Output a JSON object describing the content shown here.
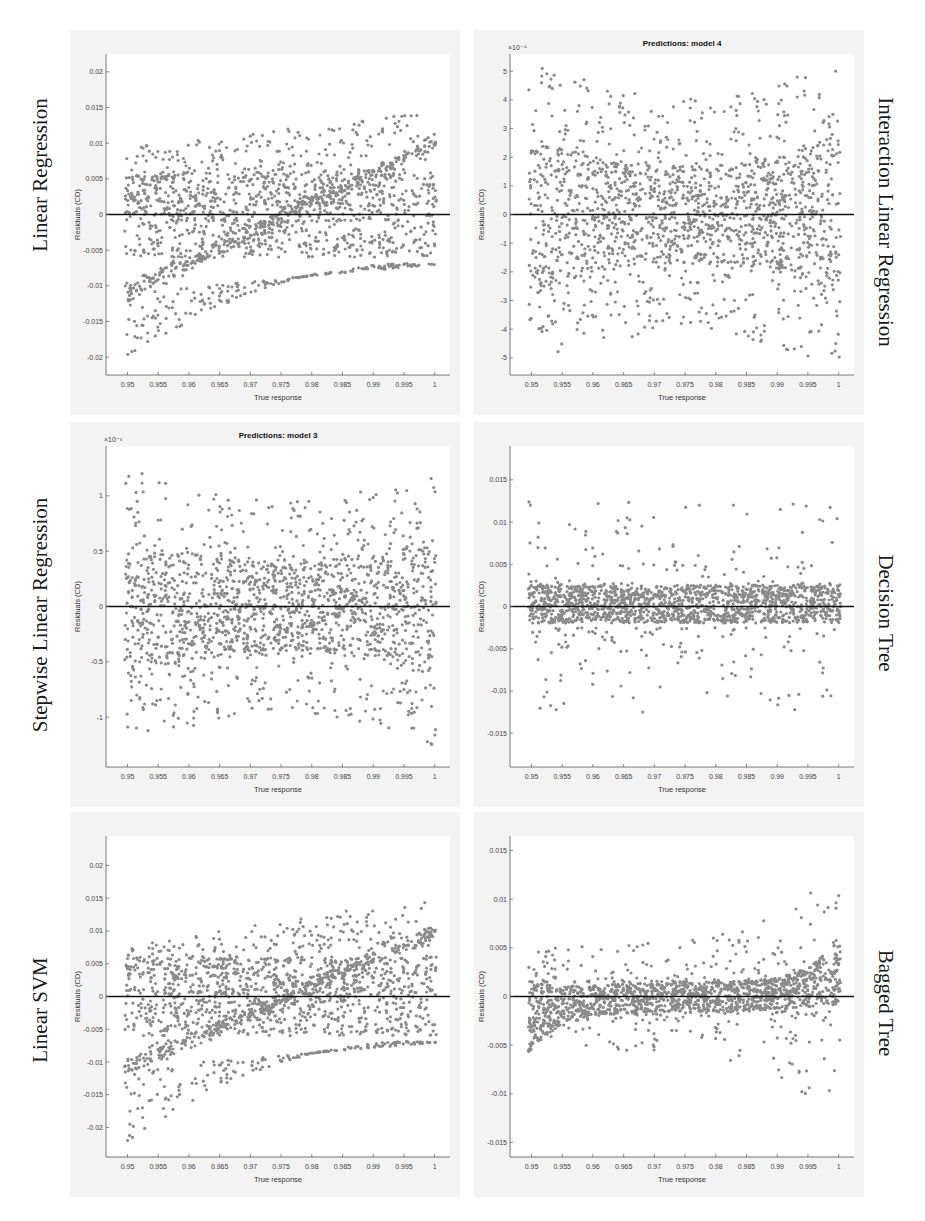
{
  "figure": {
    "side_labels": {
      "left": [
        "Linear Regression",
        "Stepwise Linear Regression",
        "Linear SVM"
      ],
      "right": [
        "Interaction Linear Regression",
        "Decision Tree",
        "Bagged Tree"
      ]
    },
    "point_color": "#8a8a8a",
    "zero_line_color": "#111111",
    "panel_bg": "#f3f3f3"
  },
  "chart_data": [
    {
      "type": "scatter",
      "model": "Linear Regression",
      "title": "",
      "xlabel": "True response",
      "ylabel": "Residuals (CD)",
      "exponent": "",
      "xlim": [
        0.9465,
        1.0025
      ],
      "ylim": [
        -0.0225,
        0.0225
      ],
      "xticks": [
        0.95,
        0.955,
        0.96,
        0.965,
        0.97,
        0.975,
        0.98,
        0.985,
        0.99,
        0.995,
        1
      ],
      "xtick_labels": [
        "0.95",
        "0.955",
        "0.96",
        "0.965",
        "0.97",
        "0.975",
        "0.98",
        "0.985",
        "0.99",
        "0.995",
        "1"
      ],
      "yticks": [
        -0.02,
        -0.015,
        -0.01,
        -0.005,
        0,
        0.005,
        0.01,
        0.015,
        0.02
      ],
      "ytick_labels": [
        "-0.02",
        "-0.015",
        "-0.01",
        "-0.005",
        "0",
        "0.005",
        "0.01",
        "0.015",
        "0.02"
      ],
      "reference_line_y": 0,
      "pattern": "linear-trend",
      "band_low": [
        -0.011,
        -0.007
      ],
      "band_high": [
        0.011,
        0.017
      ],
      "core_half_width": 0.006,
      "outlier_range": [
        -0.0205,
        0.0185
      ],
      "grid": false
    },
    {
      "type": "scatter",
      "model": "Interaction Linear Regression",
      "title": "Predictions: model 4",
      "xlabel": "True response",
      "ylabel": "Residuals (CD)",
      "exponent": "×10⁻⁴",
      "xlim": [
        0.9465,
        1.0025
      ],
      "ylim": [
        -5.6,
        5.6
      ],
      "xticks": [
        0.95,
        0.955,
        0.96,
        0.965,
        0.97,
        0.975,
        0.98,
        0.985,
        0.99,
        0.995,
        1
      ],
      "xtick_labels": [
        "0.95",
        "0.955",
        "0.96",
        "0.965",
        "0.97",
        "0.975",
        "0.98",
        "0.985",
        "0.99",
        "0.995",
        "1"
      ],
      "yticks": [
        -5,
        -4,
        -3,
        -2,
        -1,
        0,
        1,
        2,
        3,
        4,
        5
      ],
      "ytick_labels": [
        "-5",
        "-4",
        "-3",
        "-2",
        "-1",
        "0",
        "1",
        "2",
        "3",
        "4",
        "5"
      ],
      "reference_line_y": 0,
      "pattern": "symmetric-u",
      "core_half_width": 1.7,
      "outlier_range": [
        -5.1,
        5.1
      ],
      "grid": false
    },
    {
      "type": "scatter",
      "model": "Stepwise Linear Regression",
      "title": "Predictions: model 3",
      "xlabel": "True response",
      "ylabel": "Residuals (CD)",
      "exponent": "×10⁻³",
      "xlim": [
        0.9465,
        1.0025
      ],
      "ylim": [
        -1.45,
        1.45
      ],
      "xticks": [
        0.95,
        0.955,
        0.96,
        0.965,
        0.97,
        0.975,
        0.98,
        0.985,
        0.99,
        0.995,
        1
      ],
      "xtick_labels": [
        "0.95",
        "0.955",
        "0.96",
        "0.965",
        "0.97",
        "0.975",
        "0.98",
        "0.985",
        "0.99",
        "0.995",
        "1"
      ],
      "yticks": [
        -1,
        -0.5,
        0,
        0.5,
        1
      ],
      "ytick_labels": [
        "-1",
        "-0.5",
        "0",
        "0.5",
        "1"
      ],
      "reference_line_y": 0,
      "pattern": "symmetric-u",
      "core_half_width": 0.4,
      "outlier_range": [
        -1.3,
        1.2
      ],
      "grid": false
    },
    {
      "type": "scatter",
      "model": "Decision Tree",
      "title": "",
      "xlabel": "True response",
      "ylabel": "Residuals (CD)",
      "exponent": "",
      "xlim": [
        0.9465,
        1.0025
      ],
      "ylim": [
        -0.019,
        0.019
      ],
      "xticks": [
        0.95,
        0.955,
        0.96,
        0.965,
        0.97,
        0.975,
        0.98,
        0.985,
        0.99,
        0.995,
        1
      ],
      "xtick_labels": [
        "0.95",
        "0.955",
        "0.96",
        "0.965",
        "0.97",
        "0.975",
        "0.98",
        "0.985",
        "0.99",
        "0.995",
        "1"
      ],
      "yticks": [
        -0.015,
        -0.01,
        -0.005,
        0,
        0.005,
        0.01,
        0.015
      ],
      "ytick_labels": [
        "-0.015",
        "-0.01",
        "-0.005",
        "0",
        "0.005",
        "0.01",
        "0.015"
      ],
      "reference_line_y": 0,
      "pattern": "narrow-band",
      "core_half_width": 0.0025,
      "outlier_range": [
        -0.016,
        0.0175
      ],
      "grid": false
    },
    {
      "type": "scatter",
      "model": "Linear SVM",
      "title": "",
      "xlabel": "True response",
      "ylabel": "Residuals (CD)",
      "exponent": "",
      "xlim": [
        0.9465,
        1.0025
      ],
      "ylim": [
        -0.0245,
        0.0245
      ],
      "xticks": [
        0.95,
        0.955,
        0.96,
        0.965,
        0.97,
        0.975,
        0.98,
        0.985,
        0.99,
        0.995,
        1
      ],
      "xtick_labels": [
        "0.95",
        "0.955",
        "0.96",
        "0.965",
        "0.97",
        "0.975",
        "0.98",
        "0.985",
        "0.99",
        "0.995",
        "1"
      ],
      "yticks": [
        -0.02,
        -0.015,
        -0.01,
        -0.005,
        0,
        0.005,
        0.01,
        0.015,
        0.02
      ],
      "ytick_labels": [
        "-0.02",
        "-0.015",
        "-0.01",
        "-0.005",
        "0",
        "0.005",
        "0.01",
        "0.015",
        "0.02"
      ],
      "reference_line_y": 0,
      "pattern": "linear-trend",
      "band_low": [
        -0.011,
        -0.007
      ],
      "band_high": [
        0.009,
        0.018
      ],
      "core_half_width": 0.006,
      "outlier_range": [
        -0.0225,
        0.0195
      ],
      "grid": false
    },
    {
      "type": "scatter",
      "model": "Bagged Tree",
      "title": "",
      "xlabel": "True response",
      "ylabel": "Residuals (CD)",
      "exponent": "",
      "xlim": [
        0.9465,
        1.0025
      ],
      "ylim": [
        -0.0165,
        0.0165
      ],
      "xticks": [
        0.95,
        0.955,
        0.96,
        0.965,
        0.97,
        0.975,
        0.98,
        0.985,
        0.99,
        0.995,
        1
      ],
      "xtick_labels": [
        "0.95",
        "0.955",
        "0.96",
        "0.965",
        "0.97",
        "0.975",
        "0.98",
        "0.985",
        "0.99",
        "0.995",
        "1"
      ],
      "yticks": [
        -0.015,
        -0.01,
        -0.005,
        0,
        0.005,
        0.01,
        0.015
      ],
      "ytick_labels": [
        "-0.015",
        "-0.01",
        "-0.005",
        "0",
        "0.005",
        "0.01",
        "0.015"
      ],
      "reference_line_y": 0,
      "pattern": "rising-tail",
      "core_half_width": 0.0015,
      "outlier_range": [
        -0.014,
        0.015
      ],
      "grid": false
    }
  ]
}
